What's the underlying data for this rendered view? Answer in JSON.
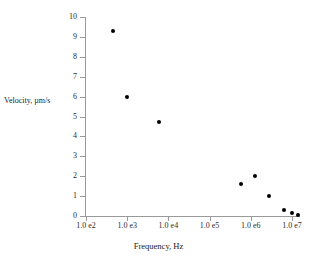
{
  "chart_data": {
    "type": "scatter",
    "title": "",
    "xlabel": "Frequency, Hz",
    "ylabel": "Velocity, µm/s",
    "xscale": "log",
    "yscale": "linear",
    "xlim": [
      100,
      10000000
    ],
    "ylim": [
      0,
      10
    ],
    "grid": false,
    "legend": null,
    "xticklabels": [
      "1.0 e2",
      "1.0 e3",
      "1.0 e4",
      "1.0 e5",
      "1.0 e6",
      "1.0 e7"
    ],
    "xtickvalues": [
      100,
      1000,
      10000,
      100000,
      1000000,
      10000000
    ],
    "yticklabels": [
      "0",
      "1",
      "2",
      "3",
      "4",
      "5",
      "6",
      "7",
      "8",
      "9",
      "10"
    ],
    "ytickvalues": [
      0,
      1,
      2,
      3,
      4,
      5,
      6,
      7,
      8,
      9,
      10
    ],
    "marker": "filled-circle",
    "marker_color": "#000000",
    "axis_color": "#9a9a9a",
    "points": [
      {
        "x": 450,
        "y": 9.3
      },
      {
        "x": 1000,
        "y": 6.0
      },
      {
        "x": 5900,
        "y": 4.7
      },
      {
        "x": 590000,
        "y": 1.6
      },
      {
        "x": 1250000,
        "y": 2.0
      },
      {
        "x": 2800000,
        "y": 1.0
      },
      {
        "x": 6300000,
        "y": 0.3
      },
      {
        "x": 10000000,
        "y": 0.15
      },
      {
        "x": 14000000,
        "y": 0.05
      }
    ]
  }
}
